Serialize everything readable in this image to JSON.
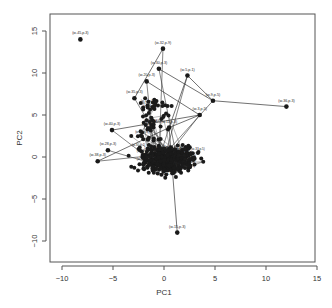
{
  "chart_data": {
    "type": "scatter",
    "title": "",
    "xlabel": "PC1",
    "ylabel": "PC2",
    "xlim": [
      -11,
      15
    ],
    "ylim": [
      -12,
      17
    ],
    "xticks": [
      -10,
      -5,
      0,
      5,
      10,
      15
    ],
    "yticks": [
      -10,
      -5,
      0,
      5,
      10,
      15
    ],
    "grid": false,
    "legend": null,
    "labeled_points": [
      {
        "label": "(w-45,p-3)",
        "x": -8.2,
        "y": 14.0
      },
      {
        "label": "(w-32,p-9)",
        "x": -0.1,
        "y": 12.9
      },
      {
        "label": "(w-5,p-1)",
        "x": 2.3,
        "y": 9.7
      },
      {
        "label": "(w-20,p-3)",
        "x": -1.7,
        "y": 9.0
      },
      {
        "label": "(w-9,p-5)",
        "x": 4.8,
        "y": 6.7
      },
      {
        "label": "(w-36,p-3)",
        "x": 12.0,
        "y": 6.0
      },
      {
        "label": "(w-40,p-3)",
        "x": -5.1,
        "y": 3.2
      },
      {
        "label": "(w-15,p-3)",
        "x": 1.3,
        "y": -9.0
      },
      {
        "label": "(w-35,p-3)",
        "x": -2.9,
        "y": 7.0
      },
      {
        "label": "(w-30,p-3)",
        "x": -0.5,
        "y": 10.5
      },
      {
        "label": "(w-3,p-5)",
        "x": 3.5,
        "y": 5.0
      },
      {
        "label": "(w-11,p-3)",
        "x": 0.5,
        "y": 3.5
      },
      {
        "label": "(w-28,p-3)",
        "x": -5.5,
        "y": 0.8
      },
      {
        "label": "(w-38,p-3)",
        "x": -6.5,
        "y": -0.5
      }
    ],
    "edges": [
      [
        1,
        8
      ],
      [
        2,
        4
      ],
      [
        4,
        5
      ],
      [
        2,
        11
      ],
      [
        3,
        10
      ],
      [
        10,
        11
      ],
      [
        9,
        4
      ],
      [
        6,
        10
      ],
      [
        13,
        11
      ],
      [
        7,
        11
      ]
    ],
    "cluster": {
      "center_x": 0.5,
      "center_y": 0.0,
      "spread_x": 4.5,
      "spread_y": 1.6,
      "n": 420
    },
    "point_color": "#1a1a1a",
    "line_color": "#333333"
  }
}
